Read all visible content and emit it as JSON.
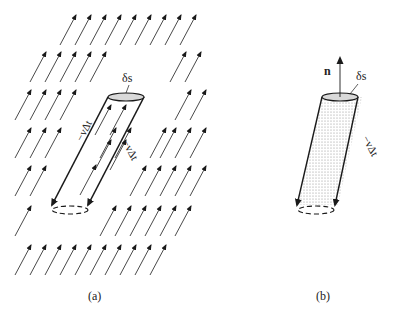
{
  "panels": [
    {
      "id": "a",
      "caption": "(a)",
      "surface_label": "δs",
      "side_label_left": "−vΔt",
      "side_label_right": "−vΔt"
    },
    {
      "id": "b",
      "caption": "(b)",
      "surface_label": "δs",
      "normal_label": "n",
      "side_label_right": "−vΔt"
    }
  ],
  "colors": {
    "stroke": "#1a1a1a",
    "fill_cap": "#d9d9d9",
    "dots": "#777777"
  }
}
